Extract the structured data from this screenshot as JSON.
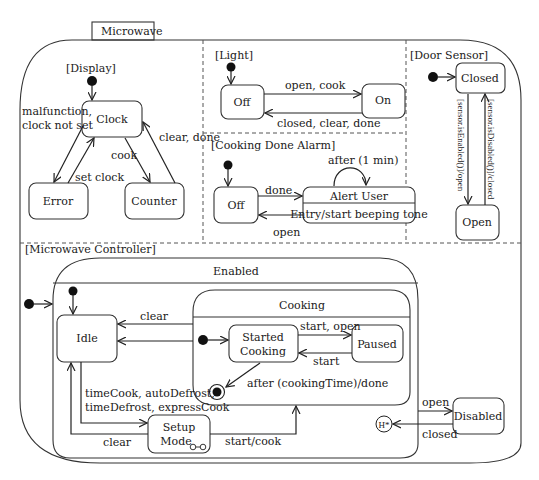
{
  "diagram": {
    "title": "Microwave",
    "colors": {
      "line": "#333333",
      "text": "#1a1a1a",
      "background": "#ffffff"
    },
    "regions": {
      "display": {
        "label": "[Display]",
        "states": {
          "clock": "Clock",
          "error": "Error",
          "counter": "Counter"
        },
        "transitions": {
          "clock_to_error": "malfunction,",
          "clock_to_error_2": "clock not set",
          "error_to_clock": "set clock",
          "clock_to_counter": "cook",
          "counter_to_clock": "clear, done"
        }
      },
      "light": {
        "label": "[Light]",
        "states": {
          "off": "Off",
          "on": "On"
        },
        "transitions": {
          "off_to_on": "open, cook",
          "on_to_off": "closed, clear, done"
        }
      },
      "cooking_done_alarm": {
        "label": "[Cooking Done Alarm]",
        "states": {
          "off": "Off",
          "alert_user": "Alert User",
          "alert_user_entry": "Entry/start beeping tone"
        },
        "transitions": {
          "off_to_alert": "done",
          "alert_to_off": "open",
          "alert_self": "after (1 min)"
        }
      },
      "door_sensor": {
        "label": "[Door Sensor]",
        "states": {
          "closed": "Closed",
          "open": "Open"
        },
        "transitions": {
          "closed_to_open": "[sensor.isEnabled()]/open",
          "open_to_closed": "[sensor.isDisabled()]/closed"
        }
      },
      "microwave_controller": {
        "label": "[Microwave Controller]",
        "enabled": {
          "label": "Enabled",
          "states": {
            "idle": "Idle",
            "setup_mode_1": "Setup",
            "setup_mode_2": "Mode"
          },
          "cooking": {
            "label": "Cooking",
            "states": {
              "started_1": "Started",
              "started_2": "Cooking",
              "paused": "Paused"
            },
            "transitions": {
              "started_to_paused": "start, open",
              "paused_to_started": "start",
              "started_to_final": "after (cookingTime)/done"
            }
          },
          "transitions": {
            "cooking_to_idle": "clear",
            "idle_to_setup_1": "timeCook, autoDefrost,",
            "idle_to_setup_2": "timeDefrost, expressCook",
            "setup_to_idle": "clear",
            "setup_to_cooking": "start/cook"
          },
          "history": "H*"
        },
        "states": {
          "disabled": "Disabled"
        },
        "transitions": {
          "enabled_to_disabled": "open",
          "disabled_to_history": "closed"
        }
      }
    }
  }
}
